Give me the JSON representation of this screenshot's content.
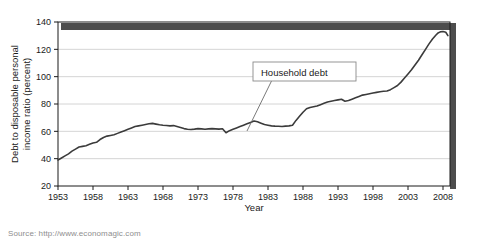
{
  "figure": {
    "source_note": "Source: http://www.economagic.com"
  },
  "annotation": {
    "label": "Household debt"
  },
  "chart_data": {
    "type": "line",
    "title": "",
    "xlabel": "Year",
    "ylabel": "Debt to disposable personal income ratio (percent)",
    "ylabel_line1": "Debt to disposable personal",
    "ylabel_line2": "income ratio (percent)",
    "xlim": [
      1953,
      2009
    ],
    "ylim": [
      20,
      140
    ],
    "yticks": [
      20,
      40,
      60,
      80,
      100,
      120,
      140
    ],
    "ytick_labels": [
      "20",
      "40",
      "60",
      "80",
      "100",
      "120",
      "140"
    ],
    "xticks": [
      1953,
      1958,
      1963,
      1968,
      1973,
      1978,
      1983,
      1988,
      1993,
      1998,
      2003,
      2008
    ],
    "xtick_labels": [
      "1953",
      "1958",
      "1963",
      "1968",
      "1973",
      "1978",
      "1983",
      "1988",
      "1993",
      "1998",
      "2003",
      "2008"
    ],
    "grid": "horizontal",
    "legend": "none",
    "line_color": "#3b3b3b",
    "series": [
      {
        "name": "Household debt",
        "x": [
          1953.0,
          1953.5,
          1954.0,
          1954.5,
          1955.0,
          1955.5,
          1956.0,
          1956.5,
          1957.0,
          1957.5,
          1958.0,
          1958.5,
          1959.0,
          1959.5,
          1960.0,
          1960.5,
          1961.0,
          1961.5,
          1962.0,
          1962.5,
          1963.0,
          1963.5,
          1964.0,
          1964.5,
          1965.0,
          1965.5,
          1966.0,
          1966.5,
          1967.0,
          1967.5,
          1968.0,
          1968.5,
          1969.0,
          1969.5,
          1970.0,
          1970.5,
          1971.0,
          1971.5,
          1972.0,
          1972.5,
          1973.0,
          1973.5,
          1974.0,
          1974.5,
          1975.0,
          1975.5,
          1976.0,
          1976.5,
          1977.0,
          1977.5,
          1978.0,
          1978.5,
          1979.0,
          1979.5,
          1980.0,
          1980.5,
          1981.0,
          1981.5,
          1982.0,
          1982.5,
          1983.0,
          1983.5,
          1984.0,
          1984.5,
          1985.0,
          1985.5,
          1986.0,
          1986.5,
          1987.0,
          1987.5,
          1988.0,
          1988.5,
          1989.0,
          1989.5,
          1990.0,
          1990.5,
          1991.0,
          1991.5,
          1992.0,
          1992.5,
          1993.0,
          1993.5,
          1994.0,
          1994.5,
          1995.0,
          1995.5,
          1996.0,
          1996.5,
          1997.0,
          1997.5,
          1998.0,
          1998.5,
          1999.0,
          1999.5,
          2000.0,
          2000.5,
          2001.0,
          2001.5,
          2002.0,
          2002.5,
          2003.0,
          2003.5,
          2004.0,
          2004.5,
          2005.0,
          2005.5,
          2006.0,
          2006.5,
          2007.0,
          2007.3,
          2007.6,
          2008.0,
          2008.4,
          2008.7
        ],
        "y": [
          39.0,
          40.5,
          42.0,
          43.5,
          45.5,
          47.0,
          48.5,
          49.0,
          49.5,
          50.5,
          51.5,
          52.0,
          54.0,
          55.5,
          56.5,
          57.0,
          57.5,
          58.5,
          59.5,
          60.5,
          61.5,
          62.5,
          63.5,
          64.0,
          64.5,
          65.0,
          65.5,
          65.8,
          65.3,
          64.8,
          64.5,
          64.3,
          64.0,
          64.2,
          63.5,
          62.8,
          62.0,
          61.5,
          61.3,
          61.6,
          62.0,
          61.8,
          61.5,
          61.8,
          62.0,
          61.8,
          61.6,
          61.9,
          59.0,
          60.5,
          61.5,
          62.5,
          63.5,
          64.5,
          65.5,
          66.5,
          67.5,
          67.0,
          66.0,
          65.0,
          64.5,
          64.0,
          63.8,
          63.7,
          63.5,
          63.8,
          64.0,
          64.5,
          68.0,
          71.0,
          74.0,
          76.5,
          77.5,
          78.0,
          78.5,
          79.5,
          80.5,
          81.5,
          82.0,
          82.5,
          83.0,
          83.5,
          82.0,
          82.5,
          83.5,
          84.5,
          85.5,
          86.5,
          87.0,
          87.5,
          88.0,
          88.5,
          89.0,
          89.3,
          89.5,
          90.5,
          92.0,
          93.5,
          96.0,
          99.0,
          102.0,
          105.0,
          108.5,
          112.0,
          116.0,
          120.0,
          124.0,
          127.5,
          130.5,
          132.0,
          132.8,
          133.0,
          132.5,
          130.0
        ]
      }
    ]
  }
}
